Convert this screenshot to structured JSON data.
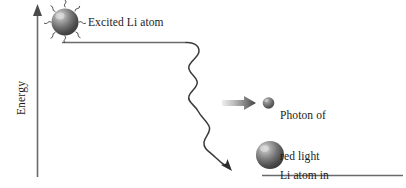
{
  "figure": {
    "background_color": "#ffffff",
    "axis": {
      "label": "Energy",
      "name": "energy-axis",
      "color": "#555555",
      "orientation": "vertical",
      "arrow_direction": "up"
    },
    "energy_levels": [
      {
        "name": "excited-state-level",
        "position": "upper-left",
        "color": "#555555"
      },
      {
        "name": "ground-state-level",
        "position": "lower-right",
        "color": "#555555"
      }
    ],
    "atoms": [
      {
        "name": "excited-li-atom",
        "label": "Excited Li atom",
        "state": "excited",
        "sphere_color": "#6e6e6e",
        "highlight_color": "#d8d8d8",
        "has_emission_squiggles": true,
        "squiggle_count": 8
      },
      {
        "name": "photon-sphere",
        "label": "Photon of\nred light\nemitted",
        "label_lines": [
          "Photon of",
          "red light",
          "emitted"
        ],
        "sphere_color": "#6e6e6e",
        "highlight_color": "#c8c8c8"
      },
      {
        "name": "ground-state-li-atom",
        "label": "Li atom in\nlower energy state",
        "label_lines": [
          "Li atom in",
          "lower energy state"
        ],
        "state": "ground",
        "sphere_color": "#6e6e6e",
        "highlight_color": "#d0d0d0"
      }
    ],
    "transition": {
      "name": "photon-emission-wave",
      "description": "wavy downward transition arrow",
      "color": "#3a3a3a",
      "arrowhead": "down-right"
    },
    "emission_arrow": {
      "name": "photon-direction-arrow",
      "direction": "right",
      "gradient_from": "#e8e8e8",
      "gradient_to": "#4a4a4a"
    }
  },
  "labels": {
    "excited_atom": "Excited Li atom",
    "photon_line_1": "Photon of",
    "photon_line_2": "red light",
    "photon_line_3": "emitted",
    "lower_atom_line_1": "Li atom in",
    "lower_atom_line_2": "lower energy state",
    "axis_energy": "Energy"
  }
}
